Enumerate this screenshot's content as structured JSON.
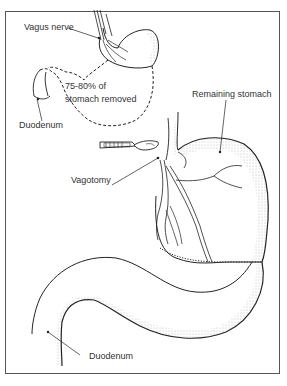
{
  "diagram": {
    "type": "medical-illustration",
    "labels": {
      "vagus_nerve": "Vagus nerve",
      "removed_line1": "75-80% of",
      "removed_line2": "stomach removed",
      "duodenum_top": "Duodenum",
      "remaining_stomach": "Remaining stomach",
      "vagotomy": "Vagotomy",
      "duodenum_bottom": "Duodenum"
    },
    "colors": {
      "line": "#222222",
      "frame": "#555555",
      "stipple": "#888888",
      "background": "#ffffff"
    }
  }
}
